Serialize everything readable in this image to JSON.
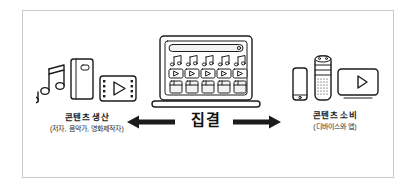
{
  "diagram": {
    "title_text_present": false,
    "left": {
      "label": "콘텐츠 생산",
      "sublabel": "(저자, 음악가, 영화제작자)",
      "icons": [
        "music-note-icon",
        "book-icon",
        "film-strip-play-icon"
      ]
    },
    "center": {
      "label": "집결",
      "device": "laptop-icon",
      "screen_rows": [
        {
          "name": "music-note-row",
          "count": 5,
          "icon": "music-note-icon"
        },
        {
          "name": "play-button-row",
          "count": 5,
          "icon": "play-button-icon"
        },
        {
          "name": "book-row",
          "count": 5,
          "icon": "book-icon"
        }
      ]
    },
    "right": {
      "label": "콘텐츠 소비",
      "sublabel": "(디바이스와 앱)",
      "icons": [
        "smartphone-icon",
        "smart-speaker-icon",
        "tv-play-icon"
      ]
    },
    "arrows": [
      {
        "name": "arrow-left",
        "direction": "left"
      },
      {
        "name": "arrow-right",
        "direction": "right"
      }
    ]
  },
  "colors": {
    "ink": "#1c1c1c",
    "frame": "#c9c9c9",
    "background": "#ffffff",
    "screen_fill": "#f2f2f2"
  }
}
